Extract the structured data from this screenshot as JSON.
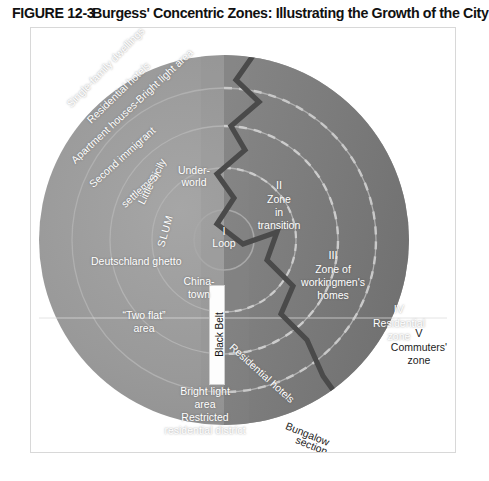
{
  "figure": {
    "number": "FIGURE 12-3",
    "title": "Burgess' Concentric Zones: Illustrating the Growth of the City"
  },
  "colors": {
    "left_half": "#9a9a9a",
    "right_half": "#7a7a7a",
    "ring_line": "#b5b5b5",
    "dashed_ring": "#c8c8c8",
    "shore_line": "#4a4a4a",
    "black_belt_fill": "#fdfdfd",
    "frame_border": "#d8d8d8",
    "label_text": "#ffffff",
    "title_text": "#111111"
  },
  "zones": [
    {
      "numeral": "I",
      "name": "Loop",
      "x": 193,
      "y": 212,
      "align": "center"
    },
    {
      "numeral": "II",
      "name": "Zone\nin\ntransition",
      "x": 248,
      "y": 163,
      "align": "center"
    },
    {
      "numeral": "III",
      "name": "Zone of\nworkingmen's\nhomes",
      "x": 305,
      "y": 248,
      "align": "center"
    },
    {
      "numeral": "IV",
      "name": "Residential\nzone",
      "x": 371,
      "y": 298,
      "align": "center"
    },
    {
      "numeral": "V",
      "name": "Commuters'\nzone",
      "x": 417,
      "y": 330,
      "align": "center"
    }
  ],
  "zone_labels": {
    "zone1_numeral": "I",
    "zone1_name": "Loop",
    "zone2_numeral": "II",
    "zone2_l1": "Zone",
    "zone2_l2": "in",
    "zone2_l3": "transition",
    "zone3_numeral": "III",
    "zone3_l1": "Zone of",
    "zone3_l2": "workingmen's",
    "zone3_l3": "homes",
    "zone4_numeral": "IV",
    "zone4_l1": "Residential",
    "zone4_l2": "zone",
    "zone5_numeral": "V",
    "zone5_l1": "Commuters'",
    "zone5_l2": "zone"
  },
  "area_labels": {
    "single_family": "Single-family dwellings",
    "residential_hotels_top": "Residential hotels",
    "apartment_houses": "Apartment houses-Bright light area",
    "second_immigrant_1": "Second immigrant",
    "second_immigrant_2": "settlement",
    "underworld_1": "Under-",
    "underworld_2": "world",
    "little_sicily": "Little Sicily",
    "slum": "SLUM",
    "deutschland_ghetto": "Deutschland ghetto",
    "chinatown_1": "China-",
    "chinatown_2": "town",
    "two_flat_1": "“Two flat”",
    "two_flat_2": "area",
    "black_belt": "Black Belt",
    "residential_hotels_diag": "Residential hotels",
    "bright_light_1": "Bright light",
    "bright_light_2": "area",
    "restricted_1": "Restricted",
    "restricted_2": "residential district",
    "bungalow_1": "Bungalow",
    "bungalow_2": "section"
  }
}
